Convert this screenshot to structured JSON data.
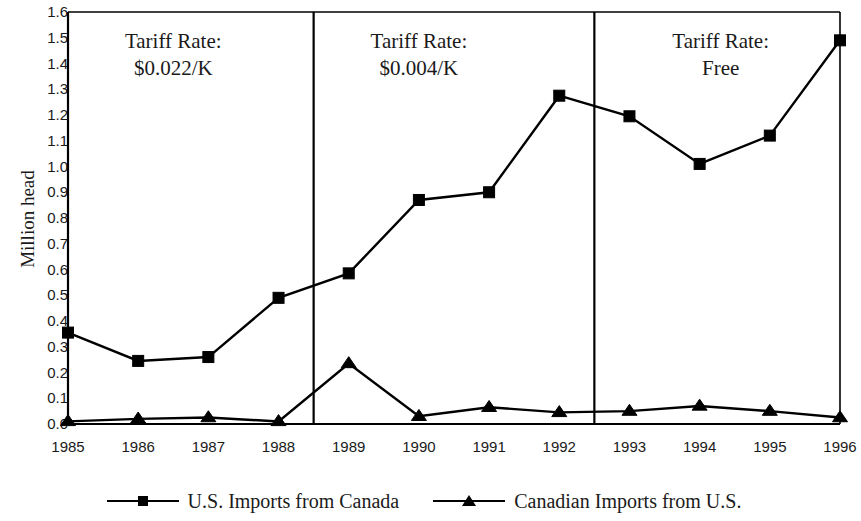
{
  "chart_data": {
    "type": "line",
    "title": "",
    "xlabel": "",
    "ylabel": "Million head",
    "categories": [
      "1985",
      "1986",
      "1987",
      "1988",
      "1989",
      "1990",
      "1991",
      "1992",
      "1993",
      "1994",
      "1995",
      "1996"
    ],
    "ylim": [
      0.0,
      1.6
    ],
    "ytick_labels": [
      "1.6",
      "1.5",
      "1.4",
      "1.3",
      "1.2",
      "1.1",
      "1.0",
      "0.9",
      "0.8",
      "0.7",
      "0.6",
      "0.5",
      "0.4",
      "0.3",
      "0.2",
      "0.1",
      "0.0"
    ],
    "ytick_values": [
      1.6,
      1.5,
      1.4,
      1.3,
      1.2,
      1.1,
      1.0,
      0.9,
      0.8,
      0.7,
      0.6,
      0.5,
      0.4,
      0.3,
      0.2,
      0.1,
      0.0
    ],
    "grid": false,
    "legend_position": "bottom",
    "series": [
      {
        "name": "U.S. Imports from Canada",
        "marker": "square",
        "values": [
          0.355,
          0.245,
          0.26,
          0.49,
          0.585,
          0.87,
          0.9,
          1.275,
          1.195,
          1.01,
          1.12,
          1.49
        ]
      },
      {
        "name": "Canadian Imports from U.S.",
        "marker": "triangle",
        "values": [
          0.01,
          0.02,
          0.025,
          0.01,
          0.235,
          0.03,
          0.065,
          0.045,
          0.05,
          0.07,
          0.05,
          0.025
        ]
      }
    ],
    "annotations": [
      {
        "id": "tariff-period-1",
        "line1": "Tariff Rate:",
        "line2": "$0.022/K",
        "x_center_year": 1986.5
      },
      {
        "id": "tariff-period-2",
        "line1": "Tariff Rate:",
        "line2": "$0.004/K",
        "x_center_year": 1990.0
      },
      {
        "id": "tariff-period-3",
        "line1": "Tariff Rate:",
        "line2": "Free",
        "x_center_year": 1994.3
      }
    ],
    "dividers": [
      {
        "id": "divider-1988-1989",
        "between": "1988/1989"
      },
      {
        "id": "divider-1992-1993",
        "between": "1992/1993"
      }
    ]
  }
}
